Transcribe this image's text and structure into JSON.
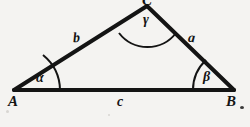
{
  "figure": {
    "type": "geometry-diagram",
    "background_color": "#f4f3f1",
    "stroke_color": "#141414",
    "vertices": [
      {
        "id": "A",
        "label": "A",
        "x": 14,
        "y": 90
      },
      {
        "id": "B",
        "label": "B",
        "x": 234,
        "y": 90
      },
      {
        "id": "C",
        "label": "C",
        "x": 147,
        "y": 6
      }
    ],
    "sides": [
      {
        "id": "a",
        "label": "a",
        "from": "B",
        "to": "C"
      },
      {
        "id": "b",
        "label": "b",
        "from": "A",
        "to": "C"
      },
      {
        "id": "c",
        "label": "c",
        "from": "A",
        "to": "B"
      }
    ],
    "angles": [
      {
        "id": "alpha",
        "label": "α",
        "at_vertex": "A"
      },
      {
        "id": "beta",
        "label": "β",
        "at_vertex": "B"
      },
      {
        "id": "gamma",
        "label": "γ",
        "at_vertex": "C"
      }
    ]
  }
}
